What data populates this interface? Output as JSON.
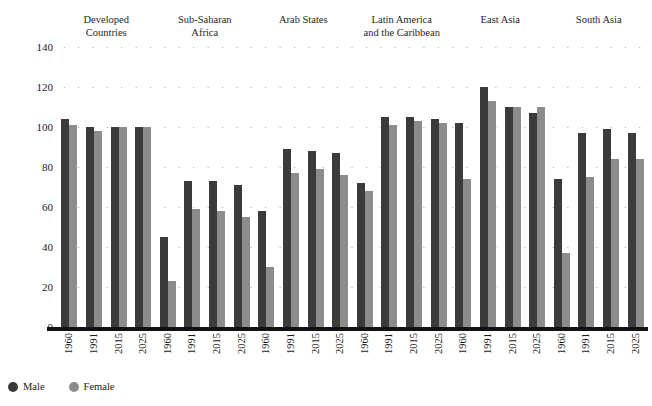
{
  "top_caption": "",
  "legend": {
    "position": "bottom-left",
    "items": [
      {
        "label": "Male",
        "color": "#3b3b3b",
        "icon": "circle-marker"
      },
      {
        "label": "Female",
        "color": "#8c8c8c",
        "icon": "circle-marker"
      }
    ]
  },
  "axis": {
    "ylabel": "",
    "xlabel": "",
    "yticks": [
      0,
      20,
      40,
      60,
      80,
      100,
      120,
      140
    ],
    "ylim": [
      0,
      140
    ],
    "grid": "dotted-horizontal"
  },
  "groups": [
    {
      "name": "Developed\nCountries"
    },
    {
      "name": "Sub-Saharan\nAfrica"
    },
    {
      "name": "Arab States"
    },
    {
      "name": "Latin America\nand the Caribbean"
    },
    {
      "name": "East Asia"
    },
    {
      "name": "South Asia"
    }
  ],
  "years": [
    "1960",
    "1991",
    "2015",
    "2025"
  ],
  "chart_data": {
    "type": "bar",
    "title": "",
    "subtitle": "",
    "xlabel": "",
    "ylabel": "",
    "ylim": [
      0,
      140
    ],
    "yticks": [
      0,
      20,
      40,
      60,
      80,
      100,
      120,
      140
    ],
    "grid": true,
    "grid_style": "dotted horizontal",
    "legend_position": "bottom-left",
    "legend_entries": [
      "Male",
      "Female"
    ],
    "categories": [
      "Developed Countries",
      "Sub-Saharan Africa",
      "Arab States",
      "Latin America and the Caribbean",
      "East Asia",
      "South Asia"
    ],
    "subcategories": [
      "1960",
      "1991",
      "2015",
      "2025"
    ],
    "series": [
      {
        "name": "Male",
        "color": "#3b3b3b",
        "values_by_group": {
          "Developed Countries": [
            104,
            100,
            100,
            100
          ],
          "Sub-Saharan Africa": [
            45,
            73,
            73,
            71
          ],
          "Arab States": [
            58,
            89,
            88,
            87
          ],
          "Latin America and the Caribbean": [
            72,
            105,
            105,
            104
          ],
          "East Asia": [
            102,
            120,
            110,
            107
          ],
          "South Asia": [
            74,
            97,
            99,
            97
          ]
        }
      },
      {
        "name": "Female",
        "color": "#8c8c8c",
        "values_by_group": {
          "Developed Countries": [
            101,
            98,
            100,
            100
          ],
          "Sub-Saharan Africa": [
            23,
            59,
            58,
            55
          ],
          "Arab States": [
            30,
            77,
            79,
            76
          ],
          "Latin America and the Caribbean": [
            68,
            101,
            103,
            102
          ],
          "East Asia": [
            74,
            113,
            110,
            110
          ],
          "South Asia": [
            37,
            75,
            84,
            84
          ]
        }
      }
    ]
  }
}
